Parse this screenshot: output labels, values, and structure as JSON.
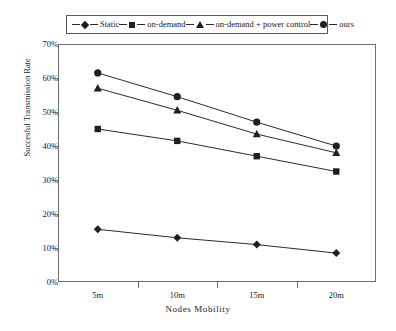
{
  "chart_data": {
    "type": "line",
    "title": "",
    "xlabel": "Nodes  Mobility",
    "ylabel": "Succesful Transmission Rate",
    "categories": [
      "5m",
      "10m",
      "15m",
      "20m"
    ],
    "x_tick_labels": [
      "5m",
      "10m",
      "15m",
      "20m"
    ],
    "y_tick_labels": [
      "0%",
      "10%",
      "20%",
      "30%",
      "40%",
      "50%",
      "60%",
      "70%"
    ],
    "y_tick_values": [
      0,
      10,
      20,
      30,
      40,
      50,
      60,
      70
    ],
    "ylim": [
      0,
      70
    ],
    "y_unit": "%",
    "grid": false,
    "legend_position": "top",
    "series": [
      {
        "name": "Static",
        "marker": "diamond",
        "color": "#1f1f1f",
        "values": [
          15.5,
          13.0,
          11.0,
          8.5
        ]
      },
      {
        "name": "on-demand",
        "marker": "square",
        "color": "#1f1f1f",
        "values": [
          45.0,
          41.5,
          37.0,
          32.5
        ]
      },
      {
        "name": "on-demand + power control",
        "marker": "triangle",
        "color": "#1f1f1f",
        "values": [
          57.0,
          50.5,
          43.5,
          38.0
        ]
      },
      {
        "name": "ours",
        "marker": "circle",
        "color": "#1f1f1f",
        "values": [
          61.5,
          54.5,
          47.0,
          40.0
        ]
      }
    ]
  },
  "legend": {
    "items": [
      {
        "label": "Static",
        "marker": "diamond"
      },
      {
        "label": "on-demand",
        "marker": "square"
      },
      {
        "label": "on-demand + power control",
        "marker": "triangle"
      },
      {
        "label": "ours",
        "marker": "circle"
      }
    ]
  },
  "colors": {
    "line": "#2b2b2b",
    "marker": "#1f1f1f",
    "axis": "#6e6e6e",
    "background": "#ffffff",
    "text": "#1a1a1a"
  }
}
